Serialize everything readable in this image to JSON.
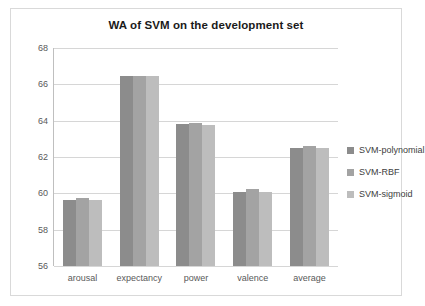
{
  "chart_data": {
    "type": "bar",
    "title": "WA of SVM on the development set",
    "xlabel": "",
    "ylabel": "",
    "ylim": [
      56,
      68
    ],
    "yticks": [
      56,
      58,
      60,
      62,
      64,
      66,
      68
    ],
    "grid": true,
    "legend_position": "right",
    "categories": [
      "arousal",
      "expectancy",
      "power",
      "valence",
      "average"
    ],
    "series": [
      {
        "name": "SVM-polynomial",
        "color": "#8c8c8c",
        "values": [
          59.65,
          66.45,
          63.8,
          60.05,
          62.5
        ]
      },
      {
        "name": "SVM-RBF",
        "color": "#a3a3a3",
        "values": [
          59.75,
          66.45,
          63.85,
          60.25,
          62.6
        ]
      },
      {
        "name": "SVM-sigmoid",
        "color": "#bdbdbd",
        "values": [
          59.65,
          66.45,
          63.75,
          60.1,
          62.5
        ]
      }
    ]
  },
  "legend": {
    "items": [
      {
        "label": "SVM-polynomial"
      },
      {
        "label": "SVM-RBF"
      },
      {
        "label": "SVM-sigmoid"
      }
    ]
  }
}
